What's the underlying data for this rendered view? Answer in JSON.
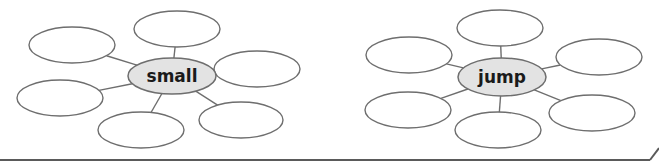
{
  "diagrams": [
    {
      "name": "small-word-web",
      "hub": {
        "label": "small",
        "cx": 172,
        "cy": 76,
        "rx": 44,
        "ry": 18,
        "fill": "#e3e3e3"
      },
      "satellites": [
        {
          "position": "top",
          "cx": 177,
          "cy": 29,
          "rx": 43,
          "ry": 18,
          "text": ""
        },
        {
          "position": "upper-left",
          "cx": 72,
          "cy": 45,
          "rx": 43,
          "ry": 18,
          "text": ""
        },
        {
          "position": "right",
          "cx": 257,
          "cy": 69,
          "rx": 43,
          "ry": 18,
          "text": ""
        },
        {
          "position": "left",
          "cx": 60,
          "cy": 98,
          "rx": 43,
          "ry": 18,
          "text": ""
        },
        {
          "position": "bottom",
          "cx": 141,
          "cy": 130,
          "rx": 43,
          "ry": 18,
          "text": ""
        },
        {
          "position": "bottom-right",
          "cx": 241,
          "cy": 120,
          "rx": 42,
          "ry": 18,
          "text": ""
        }
      ]
    },
    {
      "name": "jump-word-web",
      "hub": {
        "label": "jump",
        "cx": 502,
        "cy": 77,
        "rx": 44,
        "ry": 19,
        "fill": "#e3e3e3"
      },
      "satellites": [
        {
          "position": "top",
          "cx": 500,
          "cy": 28,
          "rx": 43,
          "ry": 18,
          "text": ""
        },
        {
          "position": "upper-left",
          "cx": 409,
          "cy": 55,
          "rx": 43,
          "ry": 18,
          "text": ""
        },
        {
          "position": "right",
          "cx": 599,
          "cy": 57,
          "rx": 43,
          "ry": 18,
          "text": ""
        },
        {
          "position": "left",
          "cx": 408,
          "cy": 110,
          "rx": 43,
          "ry": 18,
          "text": ""
        },
        {
          "position": "bottom",
          "cx": 498,
          "cy": 130,
          "rx": 43,
          "ry": 18,
          "text": ""
        },
        {
          "position": "bottom-right",
          "cx": 592,
          "cy": 113,
          "rx": 43,
          "ry": 18,
          "text": ""
        }
      ]
    }
  ],
  "colors": {
    "stroke": "#6e6e6e",
    "hub_fill": "#e3e3e3",
    "background": "#ffffff",
    "text": "#1a1a1a"
  }
}
